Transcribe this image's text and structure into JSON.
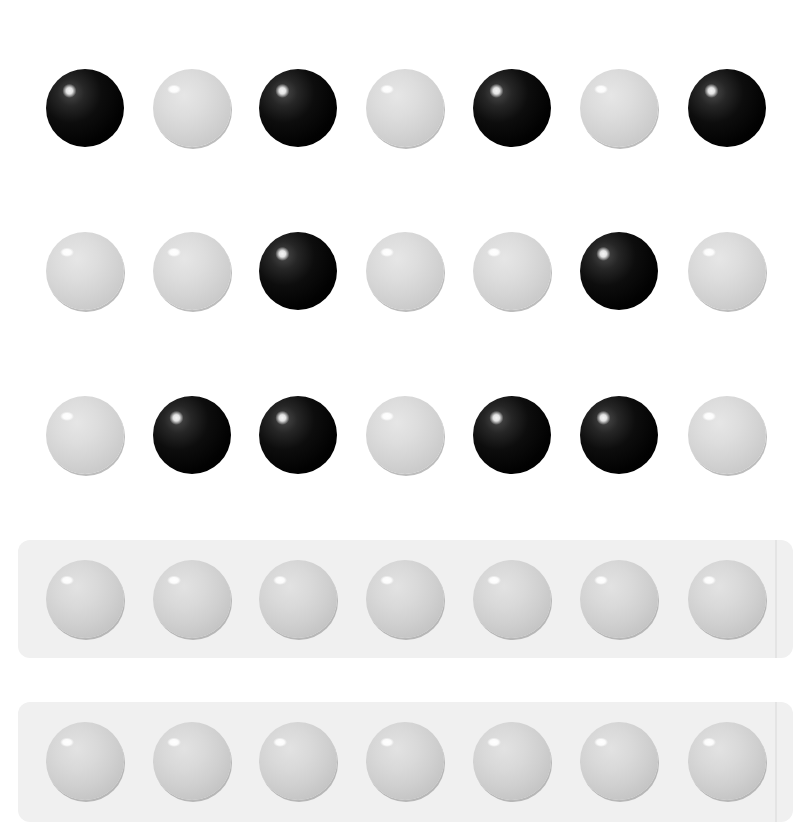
{
  "puzzle": {
    "type": "ball-sequence-pattern",
    "colors": {
      "black": "#000000",
      "white": "#d6d6d6",
      "panel_background": "#f0f0f0",
      "page_background": "#ffffff"
    },
    "ball_diameter_px": 78,
    "column_centers_x": [
      85,
      192,
      298,
      405,
      512,
      619,
      727
    ],
    "given_rows": [
      {
        "index": 1,
        "center_y": 108,
        "balls": [
          "black",
          "white",
          "black",
          "white",
          "black",
          "white",
          "black"
        ]
      },
      {
        "index": 2,
        "center_y": 271,
        "balls": [
          "white",
          "white",
          "black",
          "white",
          "white",
          "black",
          "white"
        ]
      },
      {
        "index": 3,
        "center_y": 435,
        "balls": [
          "white",
          "black",
          "black",
          "white",
          "black",
          "black",
          "white"
        ]
      }
    ],
    "answer_rows": [
      {
        "index": 4,
        "center_y": 599,
        "panel_top": 540,
        "panel_height": 118,
        "balls": [
          "empty",
          "empty",
          "empty",
          "empty",
          "empty",
          "empty",
          "empty"
        ]
      },
      {
        "index": 5,
        "center_y": 761,
        "panel_top": 702,
        "panel_height": 120,
        "balls": [
          "empty",
          "empty",
          "empty",
          "empty",
          "empty",
          "empty",
          "empty"
        ]
      }
    ]
  }
}
